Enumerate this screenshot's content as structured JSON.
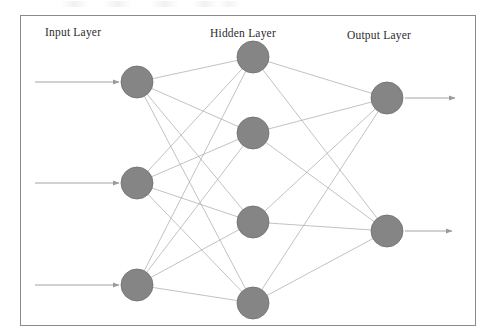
{
  "figure": {
    "background_color": "#ffffff",
    "frame": {
      "x": 20,
      "y": 15,
      "width": 455,
      "height": 310,
      "stroke_color": "#8a8a8a",
      "stroke_width": 1
    }
  },
  "labels": {
    "input": "Input Layer",
    "hidden": "Hidden Layer",
    "output": "Output Layer",
    "color": "#2b2b2b"
  },
  "style": {
    "node_fill": "#858585",
    "node_stroke": "#6e6e6e",
    "node_radius": 16,
    "edge_color": "#a8a8a8",
    "edge_width": 0.7,
    "arrow_color": "#9a9a9a",
    "arrow_width": 0.9
  },
  "chart_data": {
    "type": "diagram",
    "subtype": "feedforward-neural-network",
    "fully_connected": true,
    "layer_count": 3,
    "layer_sizes": [
      3,
      4,
      2
    ],
    "edge_count": 20,
    "layers": [
      {
        "id": "input",
        "name": "Input Layer",
        "node_count": 3,
        "x": 137,
        "nodes": [
          {
            "id": "i1",
            "cx": 137,
            "cy": 82,
            "r": 16
          },
          {
            "id": "i2",
            "cx": 137,
            "cy": 183,
            "r": 16
          },
          {
            "id": "i3",
            "cx": 137,
            "cy": 285,
            "r": 16
          }
        ],
        "incoming_arrows": [
          {
            "id": "in-arrow-1",
            "x1": 35,
            "y1": 82,
            "x2": 119,
            "y2": 82
          },
          {
            "id": "in-arrow-2",
            "x1": 35,
            "y1": 183,
            "x2": 119,
            "y2": 183
          },
          {
            "id": "in-arrow-3",
            "x1": 35,
            "y1": 285,
            "x2": 119,
            "y2": 285
          }
        ]
      },
      {
        "id": "hidden",
        "name": "Hidden Layer",
        "node_count": 4,
        "x": 253,
        "nodes": [
          {
            "id": "h1",
            "cx": 253,
            "cy": 57,
            "r": 16
          },
          {
            "id": "h2",
            "cx": 253,
            "cy": 133,
            "r": 16
          },
          {
            "id": "h3",
            "cx": 253,
            "cy": 222,
            "r": 16
          },
          {
            "id": "h4",
            "cx": 253,
            "cy": 303,
            "r": 16
          }
        ]
      },
      {
        "id": "output",
        "name": "Output Layer",
        "node_count": 2,
        "x": 387,
        "nodes": [
          {
            "id": "o1",
            "cx": 387,
            "cy": 98,
            "r": 16
          },
          {
            "id": "o2",
            "cx": 387,
            "cy": 231,
            "r": 16
          }
        ],
        "outgoing_arrows": [
          {
            "id": "out-arrow-1",
            "x1": 405,
            "y1": 98,
            "x2": 455,
            "y2": 98
          },
          {
            "id": "out-arrow-2",
            "x1": 405,
            "y1": 231,
            "x2": 452,
            "y2": 231
          }
        ]
      }
    ],
    "edges": [
      {
        "from": "i1",
        "to": "h1"
      },
      {
        "from": "i1",
        "to": "h2"
      },
      {
        "from": "i1",
        "to": "h3"
      },
      {
        "from": "i1",
        "to": "h4"
      },
      {
        "from": "i2",
        "to": "h1"
      },
      {
        "from": "i2",
        "to": "h2"
      },
      {
        "from": "i2",
        "to": "h3"
      },
      {
        "from": "i2",
        "to": "h4"
      },
      {
        "from": "i3",
        "to": "h1"
      },
      {
        "from": "i3",
        "to": "h2"
      },
      {
        "from": "i3",
        "to": "h3"
      },
      {
        "from": "i3",
        "to": "h4"
      },
      {
        "from": "h1",
        "to": "o1"
      },
      {
        "from": "h1",
        "to": "o2"
      },
      {
        "from": "h2",
        "to": "o1"
      },
      {
        "from": "h2",
        "to": "o2"
      },
      {
        "from": "h3",
        "to": "o1"
      },
      {
        "from": "h3",
        "to": "o2"
      },
      {
        "from": "h4",
        "to": "o1"
      },
      {
        "from": "h4",
        "to": "o2"
      }
    ]
  }
}
